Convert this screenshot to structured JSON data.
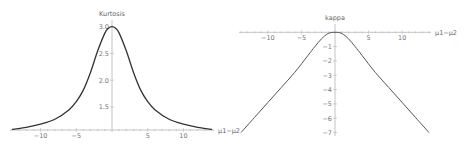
{
  "chart_data": [
    {
      "type": "line",
      "title": "Kurtosis",
      "xlabel": "μ1−μ2",
      "ylabel": "Kurtosis",
      "xlim": [
        -14,
        14
      ],
      "ylim": [
        1.07,
        3.05
      ],
      "xticks": [
        -10,
        -5,
        5,
        10
      ],
      "xtick_labels": [
        "−10",
        "−5",
        "5",
        "10"
      ],
      "yticks": [
        1.5,
        2.0,
        2.5,
        3.0
      ],
      "ytick_labels": [
        "1.5",
        "2.0",
        "2.5",
        "3.0"
      ],
      "grid": false,
      "series": [
        {
          "name": "Kurtosis",
          "color": "#333333",
          "x": [
            -14,
            -12,
            -10,
            -8,
            -6,
            -5,
            -4,
            -3,
            -2,
            -1,
            -0.5,
            0,
            0.5,
            1,
            2,
            3,
            4,
            5,
            6,
            8,
            10,
            12,
            14
          ],
          "y": [
            1.08,
            1.12,
            1.18,
            1.27,
            1.45,
            1.6,
            1.82,
            2.15,
            2.55,
            2.88,
            2.97,
            3.0,
            2.97,
            2.88,
            2.55,
            2.15,
            1.82,
            1.6,
            1.45,
            1.27,
            1.18,
            1.12,
            1.08
          ]
        }
      ]
    },
    {
      "type": "line",
      "title": "kappa",
      "xlabel": "μ1−μ2",
      "ylabel": "kappa",
      "xlim": [
        -14,
        14
      ],
      "ylim": [
        -7.1,
        0.3
      ],
      "xticks": [
        -10,
        -5,
        5,
        10
      ],
      "xtick_labels": [
        "−10",
        "−5",
        "5",
        "10"
      ],
      "yticks": [
        -1,
        -2,
        -3,
        -4,
        -5,
        -6,
        -7
      ],
      "ytick_labels": [
        "−1",
        "−2",
        "−3",
        "−4",
        "−5",
        "−6",
        "−7"
      ],
      "grid": false,
      "series": [
        {
          "name": "kappa",
          "color": "#555555",
          "x": [
            -14,
            -12,
            -10,
            -8,
            -6,
            -4,
            -3,
            -2,
            -1,
            0,
            1,
            2,
            3,
            4,
            6,
            8,
            10,
            12,
            14
          ],
          "y": [
            -7.0,
            -5.95,
            -4.9,
            -3.85,
            -2.8,
            -1.6,
            -1.0,
            -0.45,
            -0.08,
            0.0,
            -0.08,
            -0.45,
            -1.0,
            -1.6,
            -2.8,
            -3.85,
            -4.9,
            -5.95,
            -7.0
          ]
        }
      ]
    }
  ]
}
